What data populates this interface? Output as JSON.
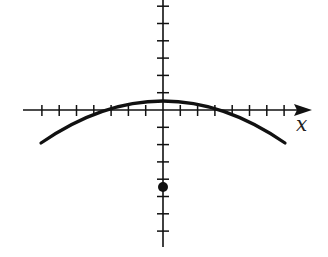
{
  "chart_data": {
    "type": "line",
    "title": "",
    "xlabel": "x",
    "ylabel": "",
    "grid": false,
    "legend": null,
    "x_ticks_unlabeled": [
      -7,
      -6,
      -5,
      -4,
      -3,
      -2,
      -1,
      1,
      2,
      3,
      4,
      5,
      6,
      7
    ],
    "y_ticks_unlabeled": [
      6,
      5,
      4,
      3,
      2,
      1,
      -1,
      -2,
      -3,
      -4,
      -5,
      -6,
      -7
    ],
    "xlim": [
      -8,
      8.5
    ],
    "ylim": [
      -8,
      6.4
    ],
    "series": [
      {
        "name": "downward parabola",
        "kind": "curve",
        "x": [
          -7,
          -6,
          -5,
          -4,
          -3,
          -2,
          -1,
          0,
          1,
          2,
          3,
          4,
          5,
          6,
          7
        ],
        "y": [
          -1.9,
          -1.3,
          -0.8,
          -0.4,
          0.0,
          0.25,
          0.45,
          0.5,
          0.45,
          0.25,
          0.0,
          -0.4,
          -0.8,
          -1.3,
          -1.9
        ]
      },
      {
        "name": "point",
        "kind": "scatter",
        "x": [
          0
        ],
        "y": [
          -4.5
        ]
      }
    ],
    "annotations": [
      {
        "text": "x",
        "position": "right end of x-axis, below arrow"
      }
    ]
  },
  "plot": {
    "origin_px": [
      163,
      110
    ],
    "unit_px": 17.3,
    "color": "#111111"
  }
}
